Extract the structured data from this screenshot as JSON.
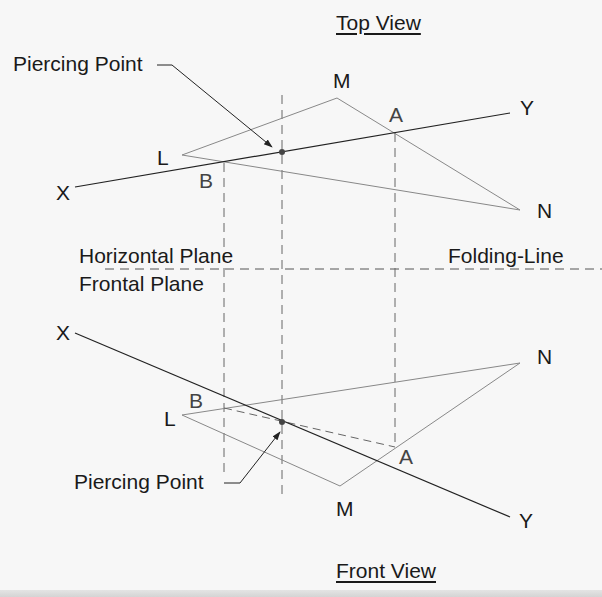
{
  "diagram": {
    "top_view_title": "Top View",
    "front_view_title": "Front View",
    "horizontal_plane_label": "Horizontal Plane",
    "frontal_plane_label": "Frontal Plane",
    "folding_line_label": "Folding-Line",
    "top_view": {
      "piercing_point_label": "Piercing Point",
      "points": {
        "L": "L",
        "M": "M",
        "N": "N",
        "X": "X",
        "Y": "Y",
        "A": "A",
        "B": "B"
      }
    },
    "front_view": {
      "piercing_point_label": "Piercing Point",
      "points": {
        "L": "L",
        "M": "M",
        "N": "N",
        "X": "X",
        "Y": "Y",
        "A": "A",
        "B": "B"
      }
    },
    "colors": {
      "background": "#f7f7f7",
      "line_dark": "#222222",
      "line_gray": "#777777",
      "dashed": "#555555"
    }
  }
}
